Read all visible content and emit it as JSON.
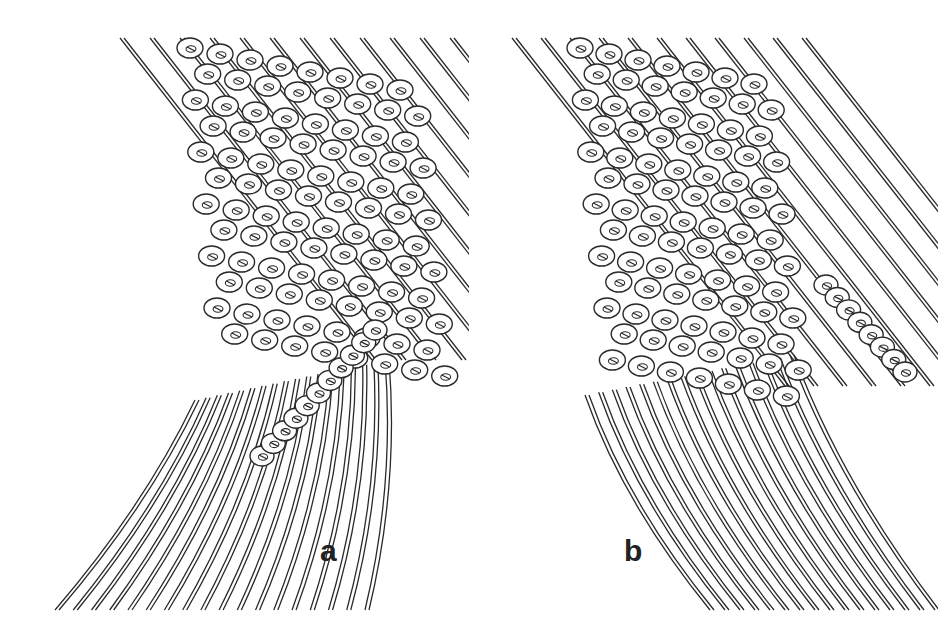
{
  "figure": {
    "colors": {
      "line": "#2a2a2a",
      "background": "#ffffff",
      "label": "#222222"
    },
    "panels": [
      {
        "id": "a",
        "label": "a",
        "label_pos": {
          "x": 320,
          "y": 556
        },
        "grid": {
          "origin_x": 190,
          "origin_y": 48,
          "cols": 8,
          "rows": 12,
          "dx": 30,
          "dy": 26,
          "shear": 9,
          "bead_rx": 13,
          "bead_ry": 10
        },
        "bead_strand": {
          "x0": 262,
          "y0": 456,
          "x1": 375,
          "y1": 330,
          "count": 11
        },
        "thread_fan": {
          "count": 18,
          "top_x0": 195,
          "top_x1": 385,
          "top_y": 400,
          "bottom_x0": 55,
          "bottom_x1": 365,
          "bottom_y": 610
        }
      },
      {
        "id": "b",
        "label": "b",
        "label_pos": {
          "x": 624,
          "y": 556
        },
        "grid": {
          "origin_x": 580,
          "origin_y": 48,
          "cols": 7,
          "rows": 13,
          "dx": 29,
          "dy": 26,
          "shear": 9,
          "bead_rx": 13,
          "bead_ry": 10
        },
        "bead_strand": {
          "x0": 826,
          "y0": 285,
          "x1": 905,
          "y1": 372,
          "count": 8
        },
        "thread_fan": {
          "count": 16,
          "top_x0": 585,
          "top_x1": 790,
          "top_y": 395,
          "bottom_x0": 710,
          "bottom_x1": 935,
          "bottom_y": 610
        }
      }
    ]
  }
}
